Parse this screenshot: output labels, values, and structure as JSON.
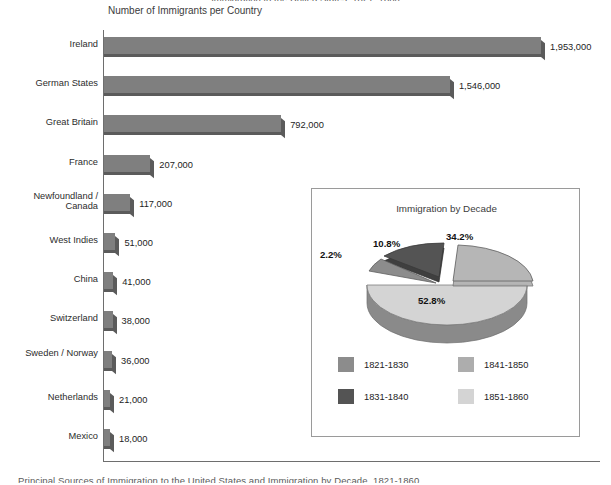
{
  "page": {
    "top_cropped_caption": "Immigration to the United States, 1821–1860",
    "bottom_cropped_caption": "Principal Sources of Immigration to the United States and Immigration by Decade, 1821-1860."
  },
  "bar_chart": {
    "title": "Number of Immigrants per Country",
    "bar_color": "#7f7f7f",
    "bar_shade_color": "#5b5b5b",
    "axis_color": "#6e6e6e"
  },
  "inset": {
    "title": "Immigration by Decade",
    "border_color": "#9a9a9a",
    "background": "#ffffff"
  },
  "chart_data": [
    {
      "type": "bar",
      "orientation": "horizontal",
      "title": "Number of Immigrants per Country",
      "xlabel": "",
      "ylabel": "",
      "grid": false,
      "legend": "none",
      "xlim": [
        0,
        2000000
      ],
      "categories": [
        "Ireland",
        "German States",
        "Great Britain",
        "France",
        "Newfoundland / Canada",
        "West Indies",
        "China",
        "Switzerland",
        "Sweden / Norway",
        "Netherlands",
        "Mexico"
      ],
      "values": [
        1953000,
        1546000,
        792000,
        207000,
        117000,
        51000,
        41000,
        38000,
        36000,
        21000,
        18000
      ],
      "value_labels": [
        "1,953,000",
        "1,546,000",
        "792,000",
        "207,000",
        "117,000",
        "51,000",
        "41,000",
        "38,000",
        "36,000",
        "21,000",
        "18,000"
      ]
    },
    {
      "type": "pie",
      "title": "Immigration by Decade",
      "style": "3d-exploded",
      "legend": "bottom",
      "categories": [
        "1821-1830",
        "1831-1840",
        "1841-1850",
        "1851-1860"
      ],
      "values": [
        2.2,
        10.8,
        34.2,
        52.8
      ],
      "value_labels": [
        "2.2%",
        "10.8%",
        "34.2%",
        "52.8%"
      ],
      "colors": [
        "#8c8c8c",
        "#545454",
        "#adadad",
        "#d4d4d4"
      ]
    }
  ]
}
